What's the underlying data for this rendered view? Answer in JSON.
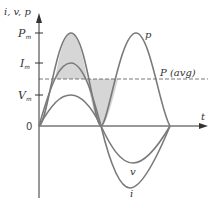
{
  "figure": {
    "y_axis_label": "i, v, p",
    "x_axis_label": "t",
    "origin_label": "0",
    "ticks": [
      {
        "main": "P",
        "sub": "m",
        "name": "Pm"
      },
      {
        "main": "I",
        "sub": "m",
        "name": "Im"
      },
      {
        "main": "V",
        "sub": "m",
        "name": "Vm"
      }
    ],
    "curve_labels": {
      "p": "p",
      "v": "v",
      "i": "i"
    },
    "avg_label": "P (avg)",
    "colors": {
      "curve": "#7a7a7a",
      "axis": "#333333",
      "shade": "#d6d6d6",
      "avg_line": "#555555"
    }
  }
}
